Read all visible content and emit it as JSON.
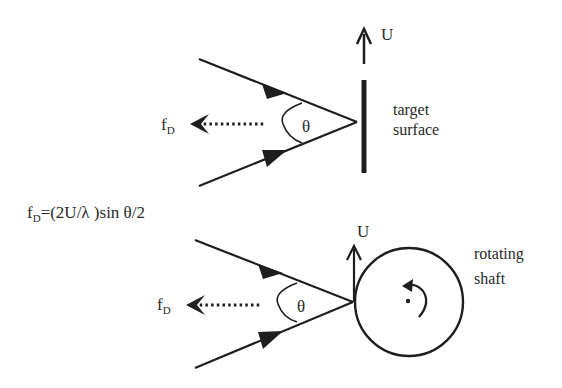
{
  "diagram": {
    "equation": {
      "lhs_base": "f",
      "lhs_sub": "D",
      "rhs": "=(2U/λ )sin θ/2"
    },
    "top_panel": {
      "velocity_label": "U",
      "angle_label": "θ",
      "doppler_label_base": "f",
      "doppler_label_sub": "D",
      "target_label_line1": "target",
      "target_label_line2": "surface"
    },
    "bottom_panel": {
      "velocity_label": "U",
      "angle_label": "θ",
      "doppler_label_base": "f",
      "doppler_label_sub": "D",
      "target_label_line1": "rotating",
      "target_label_line2": "shaft"
    },
    "colors": {
      "stroke": "#1e1e1e",
      "text": "#2a2a2a",
      "background": "#ffffff"
    }
  }
}
